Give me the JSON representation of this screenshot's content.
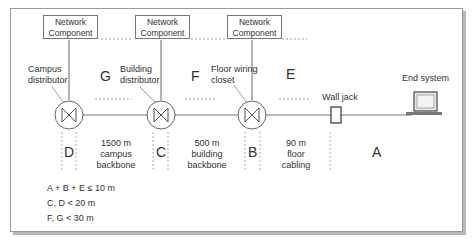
{
  "diagram": {
    "network_components": [
      {
        "line1": "Network",
        "line2": "Component"
      },
      {
        "line1": "Network",
        "line2": "Component"
      },
      {
        "line1": "Network",
        "line2": "Component"
      }
    ],
    "distributors": [
      {
        "line1": "Campus",
        "line2": "distributor"
      },
      {
        "line1": "Building",
        "line2": "distributor"
      },
      {
        "line1": "Floor wiring",
        "line2": "closet"
      }
    ],
    "wall_jack": "Wall jack",
    "end_system": "End system",
    "segment_letters": {
      "G": "G",
      "F": "F",
      "E": "E",
      "D": "D",
      "C": "C",
      "B": "B",
      "A": "A"
    },
    "cable_segments": [
      {
        "line1": "1500 m",
        "line2": "campus",
        "line3": "backbone"
      },
      {
        "line1": "500 m",
        "line2": "building",
        "line3": "backbone"
      },
      {
        "line1": "90 m",
        "line2": "floor",
        "line3": "cabling"
      }
    ],
    "rules": [
      "A + B + E ≤ 10 m",
      "C, D < 20 m",
      "F, G < 30 m"
    ],
    "colors": {
      "line": "#666666",
      "border": "#9a9a9a",
      "shadow": "#b8b8b8",
      "text": "#333333",
      "screen": "#e8e8e8"
    }
  }
}
